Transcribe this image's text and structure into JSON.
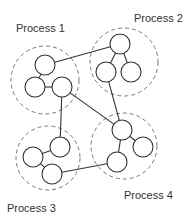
{
  "diagram": {
    "colors": {
      "line": "#333333",
      "dashed": "#777777",
      "background": "#ffffff",
      "label": "#333333"
    },
    "processes": [
      {
        "id": "p1",
        "label": "Process 1",
        "label_pos": [
          16,
          22
        ],
        "group": {
          "cx": 45,
          "cy": 80,
          "r": 34
        },
        "nodes": [
          {
            "id": "p1a",
            "cx": 45,
            "cy": 65,
            "r": 10
          },
          {
            "id": "p1b",
            "cx": 35,
            "cy": 87,
            "r": 10
          },
          {
            "id": "p1c",
            "cx": 62,
            "cy": 87,
            "r": 10
          }
        ],
        "edges": [
          [
            "p1a",
            "p1b"
          ],
          [
            "p1b",
            "p1c"
          ]
        ]
      },
      {
        "id": "p2",
        "label": "Process 2",
        "label_pos": [
          134,
          12
        ],
        "group": {
          "cx": 124,
          "cy": 62,
          "r": 34
        },
        "nodes": [
          {
            "id": "p2a",
            "cx": 120,
            "cy": 44,
            "r": 10
          },
          {
            "id": "p2b",
            "cx": 106,
            "cy": 72,
            "r": 10
          },
          {
            "id": "p2c",
            "cx": 131,
            "cy": 72,
            "r": 10
          }
        ],
        "edges": [
          [
            "p2a",
            "p2b"
          ],
          [
            "p2a",
            "p2c"
          ]
        ]
      },
      {
        "id": "p3",
        "label": "Process 3",
        "label_pos": [
          7,
          202
        ],
        "group": {
          "cx": 48,
          "cy": 158,
          "r": 32
        },
        "nodes": [
          {
            "id": "p3a",
            "cx": 60,
            "cy": 147,
            "r": 10
          },
          {
            "id": "p3b",
            "cx": 33,
            "cy": 157,
            "r": 10
          },
          {
            "id": "p3c",
            "cx": 52,
            "cy": 174,
            "r": 10
          }
        ],
        "edges": [
          [
            "p3b",
            "p3a"
          ],
          [
            "p3b",
            "p3c"
          ]
        ]
      },
      {
        "id": "p4",
        "label": "Process 4",
        "label_pos": [
          124,
          189
        ],
        "group": {
          "cx": 124,
          "cy": 146,
          "r": 33
        },
        "nodes": [
          {
            "id": "p4a",
            "cx": 122,
            "cy": 130,
            "r": 10
          },
          {
            "id": "p4b",
            "cx": 143,
            "cy": 147,
            "r": 10
          },
          {
            "id": "p4c",
            "cx": 117,
            "cy": 162,
            "r": 10
          }
        ],
        "edges": [
          [
            "p4a",
            "p4b"
          ],
          [
            "p4a",
            "p4c"
          ]
        ]
      }
    ],
    "inter_edges": [
      [
        "p1a",
        "p2a"
      ],
      [
        "p1c",
        "p4a"
      ],
      [
        "p1c",
        "p3a"
      ],
      [
        "p2b",
        "p4a"
      ],
      [
        "p3c",
        "p4c"
      ]
    ]
  }
}
